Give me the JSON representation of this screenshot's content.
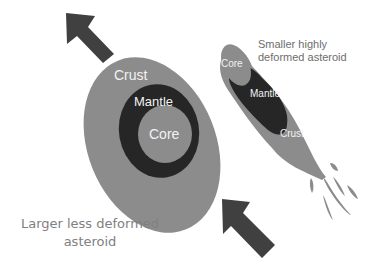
{
  "colors": {
    "background": "#ffffff",
    "crust": "#8c8c8c",
    "mantle": "#262626",
    "core": "#8c8c8c",
    "arrow": "#404040",
    "label_inside": "#f2f2f2",
    "caption": "#7a7a7a"
  },
  "large_asteroid": {
    "crust_label": "Crust",
    "mantle_label": "Mantle",
    "core_label": "Core",
    "caption_line1": "Larger less deformed",
    "caption_line2": "asteroid"
  },
  "small_asteroid": {
    "core_label": "Core",
    "mantle_label": "Mantle",
    "crust_label": "Crust",
    "caption_line1": "Smaller highly",
    "caption_line2": "deformed asteroid"
  },
  "arrows": [
    {
      "name": "top-left-arrow",
      "direction": "up-left"
    },
    {
      "name": "bottom-arrow",
      "direction": "up-left"
    }
  ]
}
